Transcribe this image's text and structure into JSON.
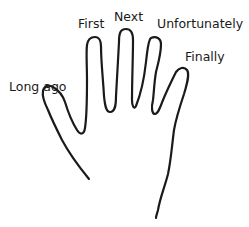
{
  "diagram": {
    "type": "hand-outline",
    "stroke_color": "#1a1a1a",
    "background": "#ffffff",
    "labels": {
      "thumb": "Long ago",
      "index": "First",
      "middle": "Next",
      "ring": "Unfortunately",
      "pinky": "Finally"
    }
  }
}
